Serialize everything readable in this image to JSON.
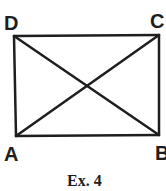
{
  "diagram": {
    "type": "rectangle-with-diagonals",
    "line_color": "#1e1e1e",
    "line_width": 2.5,
    "vertices": {
      "A": {
        "label": "A",
        "x": 16,
        "y": 136
      },
      "B": {
        "label": "B",
        "x": 159,
        "y": 135
      },
      "C": {
        "label": "C",
        "x": 159,
        "y": 35
      },
      "D": {
        "label": "D",
        "x": 14,
        "y": 36
      }
    },
    "edges": [
      [
        "A",
        "B"
      ],
      [
        "B",
        "C"
      ],
      [
        "C",
        "D"
      ],
      [
        "D",
        "A"
      ]
    ],
    "diagonals": [
      [
        "A",
        "C"
      ],
      [
        "D",
        "B"
      ]
    ]
  },
  "caption": "Ex. 4"
}
